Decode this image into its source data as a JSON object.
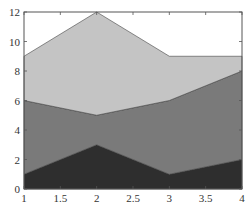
{
  "chart_data": {
    "type": "area",
    "stacked": true,
    "title": "",
    "xlabel": "",
    "ylabel": "",
    "x": [
      1,
      2,
      3,
      4
    ],
    "series": [
      {
        "name": "Series 1",
        "values": [
          1,
          3,
          1,
          2
        ],
        "color": "#2e2e2e"
      },
      {
        "name": "Series 2",
        "values": [
          5,
          2,
          5,
          6
        ],
        "color": "#7a7a7a"
      },
      {
        "name": "Series 3",
        "values": [
          3,
          7,
          3,
          1
        ],
        "color": "#c4c4c4"
      }
    ],
    "xlim": [
      1,
      4
    ],
    "ylim": [
      0,
      12
    ],
    "xticks": [
      1,
      1.5,
      2,
      2.5,
      3,
      3.5,
      4
    ],
    "xtick_labels": [
      "1",
      "1.5",
      "2",
      "2.5",
      "3",
      "3.5",
      "4"
    ],
    "yticks": [
      0,
      2,
      4,
      6,
      8,
      10,
      12
    ],
    "ytick_labels": [
      "0",
      "2",
      "4",
      "6",
      "8",
      "10",
      "12"
    ],
    "grid": false,
    "legend": null
  }
}
